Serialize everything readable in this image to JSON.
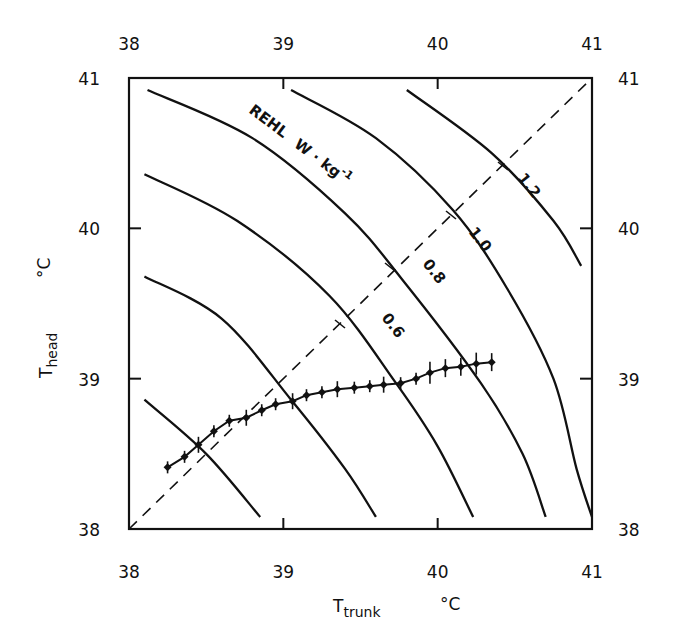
{
  "chart_data": {
    "type": "line",
    "title": "",
    "xlabel": "T_trunk",
    "xlabel_main": "T",
    "xlabel_sub": "trunk",
    "xlabel_unit": "°C",
    "ylabel": "T_head",
    "ylabel_main": "T",
    "ylabel_sub": "head",
    "ylabel_unit": "°C",
    "xlim": [
      38,
      41
    ],
    "ylim": [
      38,
      41
    ],
    "x_ticks": [
      "38",
      "39",
      "40",
      "41"
    ],
    "y_ticks": [
      "38",
      "39",
      "40",
      "41"
    ],
    "top_ticks": [
      "38",
      "39",
      "40",
      "41"
    ],
    "right_ticks": [
      "38",
      "39",
      "40",
      "41"
    ],
    "grid": false,
    "annotation": "REHL  W · kg⁻¹",
    "annotation_parts": {
      "name": "REHL",
      "unit": "W · kg",
      "exp": "-1"
    },
    "identity_line": {
      "style": "dashed",
      "from": [
        38,
        38
      ],
      "to": [
        41,
        41
      ]
    },
    "isolines": [
      {
        "label": "",
        "points": [
          [
            38.1,
            38.86
          ],
          [
            38.5,
            38.5
          ],
          [
            38.85,
            38.08
          ]
        ]
      },
      {
        "label": "",
        "points": [
          [
            38.1,
            39.68
          ],
          [
            38.6,
            39.4
          ],
          [
            39.05,
            38.86
          ],
          [
            39.4,
            38.4
          ],
          [
            39.6,
            38.08
          ]
        ]
      },
      {
        "label": "0.6",
        "points": [
          [
            38.1,
            40.36
          ],
          [
            38.7,
            40.05
          ],
          [
            39.3,
            39.55
          ],
          [
            39.73,
            38.97
          ],
          [
            40.0,
            38.55
          ],
          [
            40.23,
            38.08
          ]
        ]
      },
      {
        "label": "0.8",
        "points": [
          [
            38.12,
            40.92
          ],
          [
            38.8,
            40.6
          ],
          [
            39.4,
            40.1
          ],
          [
            39.77,
            39.66
          ],
          [
            40.28,
            38.97
          ],
          [
            40.55,
            38.5
          ],
          [
            40.7,
            38.08
          ]
        ]
      },
      {
        "label": "1.0",
        "points": [
          [
            39.05,
            40.92
          ],
          [
            39.6,
            40.6
          ],
          [
            40.1,
            40.12
          ],
          [
            40.45,
            39.6
          ],
          [
            40.75,
            39.0
          ],
          [
            40.9,
            38.4
          ],
          [
            41.0,
            38.08
          ]
        ]
      },
      {
        "label": "1.2",
        "points": [
          [
            39.8,
            40.92
          ],
          [
            40.35,
            40.5
          ],
          [
            40.75,
            40.05
          ],
          [
            40.93,
            39.75
          ]
        ]
      }
    ],
    "series": [
      {
        "name": "T_head vs T_trunk",
        "marker": "diamond",
        "error_bars": true,
        "x": [
          38.25,
          38.36,
          38.45,
          38.55,
          38.65,
          38.76,
          38.86,
          38.95,
          39.06,
          39.15,
          39.25,
          39.35,
          39.46,
          39.56,
          39.65,
          39.76,
          39.86,
          39.95,
          40.05,
          40.15,
          40.25,
          40.35
        ],
        "y": [
          38.41,
          38.48,
          38.56,
          38.65,
          38.72,
          38.74,
          38.79,
          38.83,
          38.85,
          38.89,
          38.91,
          38.93,
          38.94,
          38.95,
          38.96,
          38.97,
          39.0,
          39.04,
          39.07,
          39.08,
          39.1,
          39.11
        ]
      }
    ]
  }
}
